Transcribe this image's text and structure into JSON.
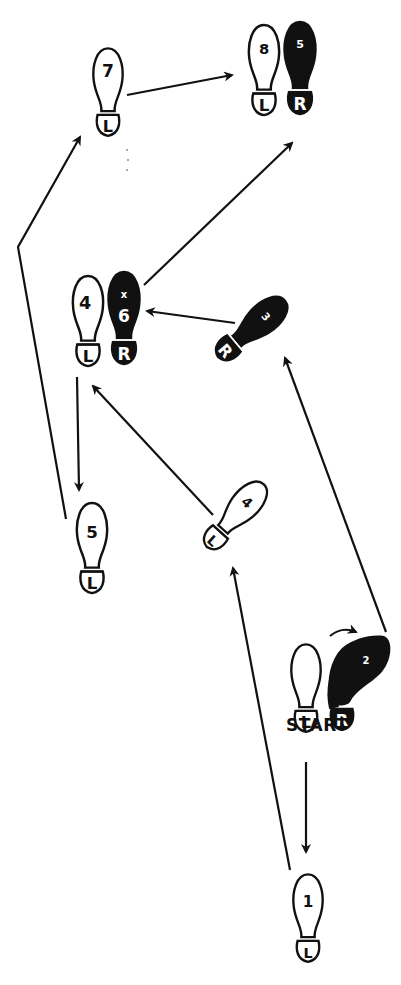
{
  "diagram": {
    "start_label": "START",
    "colors": {
      "ink": "#111111",
      "paper": "#ffffff"
    },
    "footprints": [
      {
        "id": "start-left",
        "foot": "L",
        "step": "",
        "fill": "outline"
      },
      {
        "id": "start-right",
        "foot": "R",
        "step": "2",
        "fill": "solid"
      },
      {
        "id": "step-1",
        "foot": "L",
        "step": "1",
        "fill": "outline"
      },
      {
        "id": "step-3",
        "foot": "R",
        "step": "3",
        "fill": "solid"
      },
      {
        "id": "step-4a",
        "foot": "L",
        "step": "4",
        "fill": "outline"
      },
      {
        "id": "step-4b",
        "foot": "L",
        "step": "4",
        "fill": "outline"
      },
      {
        "id": "step-6",
        "foot": "R",
        "step": "6",
        "fill": "solid",
        "extra": "x"
      },
      {
        "id": "step-5",
        "foot": "L",
        "step": "5",
        "fill": "outline"
      },
      {
        "id": "step-7",
        "foot": "L",
        "step": "7",
        "fill": "outline"
      },
      {
        "id": "step-8",
        "foot": "L",
        "step": "8",
        "fill": "outline"
      },
      {
        "id": "step-8r",
        "foot": "R",
        "step": "5",
        "fill": "solid"
      }
    ],
    "labels": {
      "L": "L",
      "R": "R",
      "n1": "1",
      "n2": "2",
      "n3": "3",
      "n4": "4",
      "n5": "5",
      "n6": "6",
      "n7": "7",
      "n8": "8",
      "x": "x"
    }
  }
}
